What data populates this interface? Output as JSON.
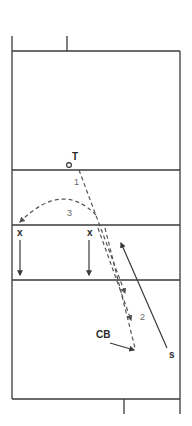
{
  "diagram": {
    "type": "volleyball court play diagram",
    "colors": {
      "line": "#3a3a3a",
      "dashed": "#555555",
      "number": "#666666"
    },
    "players": {
      "tipper": {
        "marker": "circle-icon",
        "label": "T"
      },
      "blocker_left": {
        "label": "x"
      },
      "blocker_middle": {
        "label": "x"
      },
      "cover_back": {
        "label": "CB"
      },
      "setter": {
        "label": "s"
      }
    },
    "paths": [
      {
        "id": "1",
        "label": "1",
        "style": "dashed",
        "from": "T",
        "to": "net"
      },
      {
        "id": "2",
        "label": "2",
        "style": "dashed",
        "from": "net",
        "to": "CB"
      },
      {
        "id": "3",
        "label": "3",
        "style": "dashed-arc",
        "from": "net",
        "to": "left-sideline"
      }
    ]
  }
}
